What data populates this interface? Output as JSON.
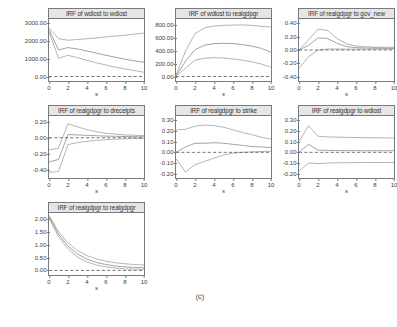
{
  "figure": {
    "caption": "(c)",
    "xlabel": "s",
    "xticks": [
      "0",
      "2",
      "4",
      "6",
      "8",
      "10"
    ],
    "xlim": [
      0,
      10
    ],
    "band_color": "#8a8a8a",
    "line_color": "#6e6e6e",
    "zero_color": "#3a3a3a",
    "title_bg": "#e6e6e6",
    "frame_color": "#7a7a7a"
  },
  "chart_data": [
    {
      "type": "line",
      "title": "IRF of wdlost to wdlost",
      "xlabel": "s",
      "ylabel": "",
      "grid": false,
      "legend": "none",
      "xlim": [
        0,
        10
      ],
      "ylim": [
        -250,
        3200
      ],
      "yticks": [
        "3000.00",
        "2000.00",
        "1000.00",
        "0.00"
      ],
      "ytickvals": [
        3000,
        2000,
        1000,
        0
      ],
      "x": [
        0,
        1,
        2,
        3,
        4,
        5,
        6,
        7,
        8,
        9,
        10
      ],
      "series": [
        {
          "name": "upper",
          "values": [
            2700,
            2100,
            2020,
            2060,
            2100,
            2150,
            2200,
            2250,
            2300,
            2360,
            2420
          ]
        },
        {
          "name": "estimate",
          "values": [
            2600,
            1480,
            1610,
            1530,
            1420,
            1300,
            1180,
            1070,
            960,
            870,
            790
          ]
        },
        {
          "name": "lower",
          "values": [
            2500,
            1020,
            1180,
            1050,
            900,
            760,
            640,
            520,
            420,
            330,
            240
          ]
        },
        {
          "name": "zero",
          "values": [
            0,
            0,
            0,
            0,
            0,
            0,
            0,
            0,
            0,
            0,
            0
          ]
        }
      ]
    },
    {
      "type": "line",
      "title": "IRF of wdlost to realgdpgr",
      "xlabel": "s",
      "ylabel": "",
      "grid": false,
      "legend": "none",
      "xlim": [
        0,
        10
      ],
      "ylim": [
        -70,
        900
      ],
      "yticks": [
        "800.00",
        "600.00",
        "400.00",
        "200.00",
        "0.00"
      ],
      "ytickvals": [
        800,
        600,
        400,
        200,
        0
      ],
      "x": [
        0,
        1,
        2,
        3,
        4,
        5,
        6,
        7,
        8,
        9,
        10
      ],
      "series": [
        {
          "name": "upper",
          "values": [
            20,
            400,
            670,
            760,
            790,
            800,
            805,
            808,
            800,
            785,
            775
          ]
        },
        {
          "name": "estimate",
          "values": [
            10,
            240,
            420,
            490,
            515,
            520,
            515,
            500,
            475,
            440,
            380
          ]
        },
        {
          "name": "lower",
          "values": [
            5,
            130,
            255,
            285,
            295,
            290,
            275,
            255,
            230,
            195,
            145
          ]
        },
        {
          "name": "zero",
          "values": [
            0,
            0,
            0,
            0,
            0,
            0,
            0,
            0,
            0,
            0,
            0
          ]
        }
      ]
    },
    {
      "type": "line",
      "title": "IRF of realgdpgr to gov_new",
      "xlabel": "s",
      "ylabel": "",
      "grid": false,
      "legend": "none",
      "xlim": [
        0,
        10
      ],
      "ylim": [
        -0.46,
        0.46
      ],
      "yticks": [
        "0.40",
        "0.20",
        "0.00",
        "-0.20",
        "-0.40"
      ],
      "ytickvals": [
        0.4,
        0.2,
        0,
        -0.2,
        -0.4
      ],
      "x": [
        0,
        1,
        2,
        3,
        4,
        5,
        6,
        7,
        8,
        9,
        10
      ],
      "series": [
        {
          "name": "upper",
          "values": [
            0.0,
            0.15,
            0.31,
            0.29,
            0.17,
            0.09,
            0.06,
            0.05,
            0.04,
            0.04,
            0.04
          ]
        },
        {
          "name": "estimate",
          "values": [
            0.0,
            0.07,
            0.18,
            0.17,
            0.1,
            0.05,
            0.035,
            0.03,
            0.028,
            0.026,
            0.025
          ]
        },
        {
          "name": "lower",
          "values": [
            -0.27,
            -0.1,
            0.0,
            0.015,
            0.015,
            0.013,
            0.013,
            0.013,
            0.014,
            0.015,
            0.016
          ]
        },
        {
          "name": "zero",
          "values": [
            0,
            0,
            0,
            0,
            0,
            0,
            0,
            0,
            0,
            0,
            0
          ]
        }
      ]
    },
    {
      "type": "line",
      "title": "IRF of realgdpgr to drecelpts",
      "xlabel": "s",
      "ylabel": "",
      "grid": false,
      "legend": "none",
      "xlim": [
        0,
        10
      ],
      "ylim": [
        -0.5,
        0.27
      ],
      "yticks": [
        "0.20",
        "0.00",
        "-0.20",
        "-0.40"
      ],
      "ytickvals": [
        0.2,
        0,
        -0.2,
        -0.4
      ],
      "x": [
        0,
        1,
        2,
        3,
        4,
        5,
        6,
        7,
        8,
        9,
        10
      ],
      "series": [
        {
          "name": "upper",
          "values": [
            -0.15,
            -0.13,
            0.175,
            0.135,
            0.1,
            0.075,
            0.055,
            0.045,
            0.035,
            0.03,
            0.028
          ]
        },
        {
          "name": "estimate",
          "values": [
            -0.3,
            -0.27,
            0.04,
            0.035,
            0.03,
            0.025,
            0.02,
            0.018,
            0.015,
            0.013,
            0.012
          ]
        },
        {
          "name": "lower",
          "values": [
            -0.43,
            -0.42,
            -0.085,
            -0.06,
            -0.045,
            -0.032,
            -0.024,
            -0.018,
            -0.013,
            -0.01,
            -0.008
          ]
        },
        {
          "name": "zero",
          "values": [
            0,
            0,
            0,
            0,
            0,
            0,
            0,
            0,
            0,
            0,
            0
          ]
        }
      ]
    },
    {
      "type": "line",
      "title": "IRF of realgdpgr to strike",
      "xlabel": "s",
      "ylabel": "",
      "grid": false,
      "legend": "none",
      "xlim": [
        0,
        10
      ],
      "ylim": [
        -0.24,
        0.34
      ],
      "yticks": [
        "0.30",
        "0.20",
        "0.10",
        "0.00",
        "-0.10",
        "-0.20"
      ],
      "ytickvals": [
        0.3,
        0.2,
        0.1,
        0,
        -0.1,
        -0.2
      ],
      "x": [
        0,
        1,
        2,
        3,
        4,
        5,
        6,
        7,
        8,
        9,
        10
      ],
      "series": [
        {
          "name": "upper",
          "values": [
            0.21,
            0.215,
            0.245,
            0.255,
            0.25,
            0.235,
            0.21,
            0.185,
            0.165,
            0.14,
            0.125
          ]
        },
        {
          "name": "estimate",
          "values": [
            0.0,
            0.05,
            0.085,
            0.085,
            0.09,
            0.085,
            0.075,
            0.065,
            0.055,
            0.05,
            0.045
          ]
        },
        {
          "name": "lower",
          "values": [
            -0.06,
            -0.185,
            -0.115,
            -0.085,
            -0.055,
            -0.025,
            -0.008,
            0.0,
            0.005,
            0.008,
            0.01
          ]
        },
        {
          "name": "zero",
          "values": [
            0,
            0,
            0,
            0,
            0,
            0,
            0,
            0,
            0,
            0,
            0
          ]
        }
      ]
    },
    {
      "type": "line",
      "title": "IRF of realgdpgr to wdlost",
      "xlabel": "s",
      "ylabel": "",
      "grid": false,
      "legend": "none",
      "xlim": [
        0,
        10
      ],
      "ylim": [
        -0.24,
        0.34
      ],
      "yticks": [
        "0.30",
        "0.20",
        "0.10",
        "0.00",
        "-0.10",
        "-0.20"
      ],
      "ytickvals": [
        0.3,
        0.2,
        0.1,
        0,
        -0.1,
        -0.2
      ],
      "x": [
        0,
        1,
        2,
        3,
        4,
        5,
        6,
        7,
        8,
        9,
        10
      ],
      "series": [
        {
          "name": "upper",
          "values": [
            0.1,
            0.25,
            0.15,
            0.145,
            0.142,
            0.14,
            0.138,
            0.137,
            0.136,
            0.135,
            0.135
          ]
        },
        {
          "name": "estimate",
          "values": [
            0.0,
            0.075,
            0.02,
            0.018,
            0.017,
            0.016,
            0.016,
            0.015,
            0.015,
            0.015,
            0.015
          ]
        },
        {
          "name": "lower",
          "values": [
            -0.175,
            -0.1,
            -0.105,
            -0.1,
            -0.098,
            -0.097,
            -0.096,
            -0.095,
            -0.095,
            -0.095,
            -0.095
          ]
        },
        {
          "name": "zero",
          "values": [
            0,
            0,
            0,
            0,
            0,
            0,
            0,
            0,
            0,
            0,
            0
          ]
        }
      ]
    },
    {
      "type": "line",
      "title": "IRF of realgdpgr to realgdpgr",
      "xlabel": "s",
      "ylabel": "",
      "grid": false,
      "legend": "none",
      "xlim": [
        0,
        10
      ],
      "ylim": [
        -0.18,
        2.25
      ],
      "yticks": [
        "2.00",
        "1.50",
        "1.00",
        "0.50",
        "0.00"
      ],
      "ytickvals": [
        2.0,
        1.5,
        1.0,
        0.5,
        0.0
      ],
      "x": [
        0,
        1,
        2,
        3,
        4,
        5,
        6,
        7,
        8,
        9,
        10
      ],
      "series": [
        {
          "name": "upper",
          "values": [
            2.16,
            1.52,
            1.08,
            0.78,
            0.58,
            0.45,
            0.36,
            0.3,
            0.26,
            0.23,
            0.21
          ]
        },
        {
          "name": "estimate",
          "values": [
            2.1,
            1.42,
            0.95,
            0.64,
            0.44,
            0.31,
            0.23,
            0.17,
            0.14,
            0.12,
            0.1
          ]
        },
        {
          "name": "lower",
          "values": [
            2.05,
            1.32,
            0.84,
            0.52,
            0.33,
            0.21,
            0.14,
            0.09,
            0.06,
            0.05,
            0.04
          ]
        },
        {
          "name": "zero",
          "values": [
            0,
            0,
            0,
            0,
            0,
            0,
            0,
            0,
            0,
            0,
            0
          ]
        }
      ]
    }
  ],
  "panels_layout": [
    {
      "left": 18,
      "top": 8
    },
    {
      "left": 145,
      "top": 8
    },
    {
      "left": 268,
      "top": 8
    },
    {
      "left": 18,
      "top": 105
    },
    {
      "left": 145,
      "top": 105
    },
    {
      "left": 268,
      "top": 105
    },
    {
      "left": 18,
      "top": 202
    }
  ],
  "caption_pos": {
    "left": 150,
    "top": 292,
    "width": 100
  }
}
